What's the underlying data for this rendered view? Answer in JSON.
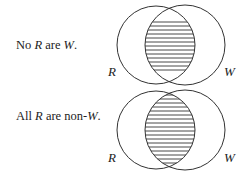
{
  "diagrams": [
    {
      "statement": {
        "prefix": "No ",
        "var1": "R",
        "middle": " are ",
        "var2": "W",
        "suffix": "."
      },
      "left_label": "R",
      "right_label": "W",
      "shaded_region": "intersection"
    },
    {
      "statement": {
        "prefix": "All ",
        "var1": "R",
        "middle": " are non-",
        "var2": "W",
        "suffix": "."
      },
      "left_label": "R",
      "right_label": "W",
      "shaded_region": "intersection"
    }
  ],
  "colors": {
    "stroke": "#333333",
    "text": "#222222",
    "background": "#ffffff"
  }
}
